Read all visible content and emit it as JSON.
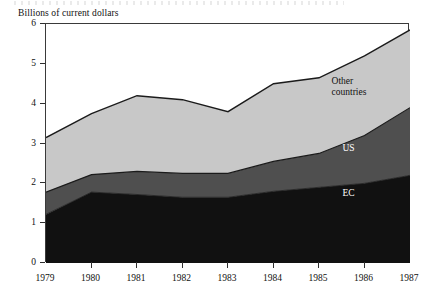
{
  "chart_data": {
    "type": "area",
    "stacked": true,
    "title": "",
    "ylabel": "Billions of current dollars",
    "xlabel": "",
    "categories": [
      "1979",
      "1980",
      "1981",
      "1982",
      "1983",
      "1984",
      "1985",
      "1986",
      "1987"
    ],
    "x": [
      1979,
      1980,
      1981,
      1982,
      1983,
      1984,
      1985,
      1986,
      1987
    ],
    "ylim": [
      0,
      6
    ],
    "xlim": [
      1979,
      1987
    ],
    "yticks": [
      "0",
      "1",
      "2",
      "3",
      "4",
      "5",
      "6"
    ],
    "ytick_values": [
      0,
      1,
      2,
      3,
      4,
      5,
      6
    ],
    "grid": false,
    "legend_position": "inline-annotations",
    "series": [
      {
        "name": "EC",
        "order": 1,
        "color": "#111111",
        "label_color": "#ffffff",
        "values": [
          1.22,
          1.78,
          1.72,
          1.65,
          1.65,
          1.8,
          1.9,
          2.0,
          2.2
        ]
      },
      {
        "name": "US",
        "order": 2,
        "color": "#4f4f4f",
        "label_color": "#ffffff",
        "values": [
          0.56,
          0.44,
          0.58,
          0.6,
          0.6,
          0.75,
          0.85,
          1.2,
          1.7
        ]
      },
      {
        "name": "Other countries",
        "order": 3,
        "color": "#c8c8c8",
        "label_color": "#111111",
        "values": [
          1.37,
          1.53,
          1.9,
          1.85,
          1.55,
          1.95,
          1.9,
          2.0,
          1.95
        ]
      }
    ],
    "cumulative": {
      "ec_top": [
        1.22,
        1.78,
        1.72,
        1.65,
        1.65,
        1.8,
        1.9,
        2.0,
        2.2
      ],
      "us_top": [
        1.78,
        2.22,
        2.3,
        2.25,
        2.25,
        2.55,
        2.75,
        3.2,
        3.9
      ],
      "total_top": [
        3.15,
        3.75,
        4.2,
        4.1,
        3.8,
        4.5,
        4.65,
        5.2,
        5.85
      ]
    },
    "annotations": [
      {
        "name": "other-countries",
        "text": "Other\ncountries",
        "x_frac": 0.845,
        "y_value": 4.55
      },
      {
        "name": "us",
        "text": "US",
        "x_frac": 0.875,
        "y_value": 2.85
      },
      {
        "name": "ec",
        "text": "EC",
        "x_frac": 0.875,
        "y_value": 1.72
      }
    ]
  },
  "colors": {
    "ec": "#111111",
    "us": "#4f4f4f",
    "other_countries": "#c8c8c8",
    "frame": "#3a3a3a",
    "background": "#ffffff"
  }
}
